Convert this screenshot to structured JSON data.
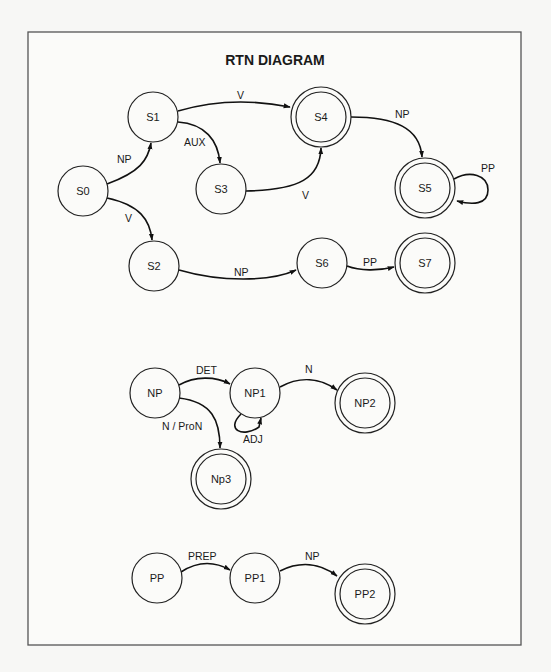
{
  "diagram": {
    "title": "RTN DIAGRAM",
    "colors": {
      "stroke": "#111111",
      "frame": "#555555",
      "background": "#fbfbf9"
    },
    "networks": [
      {
        "name": "S",
        "nodes": [
          {
            "id": "S0",
            "label": "S0",
            "final": false
          },
          {
            "id": "S1",
            "label": "S1",
            "final": false
          },
          {
            "id": "S2",
            "label": "S2",
            "final": false
          },
          {
            "id": "S3",
            "label": "S3",
            "final": false
          },
          {
            "id": "S4",
            "label": "S4",
            "final": true
          },
          {
            "id": "S5",
            "label": "S5",
            "final": true
          },
          {
            "id": "S6",
            "label": "S6",
            "final": false
          },
          {
            "id": "S7",
            "label": "S7",
            "final": true
          }
        ],
        "edges": [
          {
            "from": "S0",
            "to": "S1",
            "label": "NP"
          },
          {
            "from": "S0",
            "to": "S2",
            "label": "V"
          },
          {
            "from": "S1",
            "to": "S4",
            "label": "V"
          },
          {
            "from": "S1",
            "to": "S3",
            "label": "AUX"
          },
          {
            "from": "S3",
            "to": "S4",
            "label": "V"
          },
          {
            "from": "S4",
            "to": "S5",
            "label": "NP"
          },
          {
            "from": "S5",
            "to": "S5",
            "label": "PP"
          },
          {
            "from": "S2",
            "to": "S6",
            "label": "NP"
          },
          {
            "from": "S6",
            "to": "S7",
            "label": "PP"
          }
        ]
      },
      {
        "name": "NP",
        "nodes": [
          {
            "id": "NP",
            "label": "NP",
            "final": false
          },
          {
            "id": "NP1",
            "label": "NP1",
            "final": false
          },
          {
            "id": "NP2",
            "label": "NP2",
            "final": true
          },
          {
            "id": "Np3",
            "label": "Np3",
            "final": true
          }
        ],
        "edges": [
          {
            "from": "NP",
            "to": "NP1",
            "label": "DET"
          },
          {
            "from": "NP1",
            "to": "NP1",
            "label": "ADJ"
          },
          {
            "from": "NP1",
            "to": "NP2",
            "label": "N"
          },
          {
            "from": "NP",
            "to": "Np3",
            "label": "N / ProN"
          }
        ]
      },
      {
        "name": "PP",
        "nodes": [
          {
            "id": "PP",
            "label": "PP",
            "final": false
          },
          {
            "id": "PP1",
            "label": "PP1",
            "final": false
          },
          {
            "id": "PP2",
            "label": "PP2",
            "final": true
          }
        ],
        "edges": [
          {
            "from": "PP",
            "to": "PP1",
            "label": "PREP"
          },
          {
            "from": "PP1",
            "to": "PP2",
            "label": "NP"
          }
        ]
      }
    ]
  }
}
